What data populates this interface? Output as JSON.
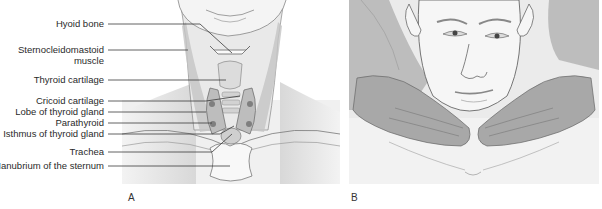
{
  "figure": {
    "panel_a": {
      "letter": "A",
      "title": "Anatomy of the anterior neck and thyroid gland",
      "labels": [
        {
          "text": "Hyoid bone",
          "y": 24
        },
        {
          "text": "Sternocleidomastoid",
          "text2": "muscle",
          "y": 50
        },
        {
          "text": "Thyroid cartilage",
          "y": 80
        },
        {
          "text": "Cricoid cartilage",
          "y": 101
        },
        {
          "text": "Lobe of thyroid gland",
          "y": 112
        },
        {
          "text": "Parathyroid",
          "y": 123
        },
        {
          "text": "Isthmus of thyroid gland",
          "y": 134
        },
        {
          "text": "Trachea",
          "y": 152
        },
        {
          "text": "Manubrium of the sternum",
          "y": 166
        }
      ]
    },
    "panel_b": {
      "letter": "B",
      "title": "Examiner palpating thyroid from behind the patient"
    },
    "colors": {
      "background": "#ffffff",
      "skin": "#f1f1f1",
      "shade": "#c9c9c9",
      "dark_shade": "#9a9a9a",
      "hands": "#a8a8a8",
      "line": "#3a3a3a"
    }
  }
}
